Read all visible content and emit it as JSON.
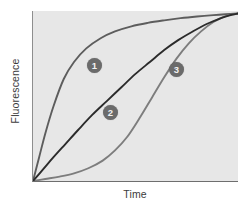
{
  "chart_data": {
    "type": "line",
    "title": "",
    "xlabel": "Time",
    "ylabel": "Fluorescence",
    "grid": false,
    "legend": "inline-markers",
    "xlim": [
      0,
      100
    ],
    "ylim": [
      0,
      100
    ],
    "axis_ticks": {
      "x": [],
      "y": []
    },
    "series": [
      {
        "name": "1",
        "marker_label": "1",
        "color": "#5d5d5d",
        "description": "rapid hyperbolic rise reaching plateau early",
        "x": [
          0,
          3,
          6,
          10,
          15,
          20,
          26,
          33,
          40,
          48,
          56,
          64,
          72,
          80,
          88,
          94,
          100
        ],
        "y": [
          0,
          14,
          28,
          44,
          60,
          70,
          78,
          84,
          88,
          91,
          93,
          94.5,
          95.8,
          96.8,
          97.6,
          98.1,
          98.5
        ]
      },
      {
        "name": "2",
        "marker_label": "2",
        "color": "#2b2b2b",
        "description": "near-linear then gradual saturation",
        "x": [
          0,
          5,
          10,
          16,
          22,
          29,
          36,
          43,
          50,
          57,
          64,
          71,
          78,
          85,
          92,
          96,
          100
        ],
        "y": [
          0,
          7,
          14,
          22,
          30,
          39,
          47,
          55,
          63,
          70,
          77,
          83,
          88,
          92.5,
          96,
          97.5,
          98.5
        ]
      },
      {
        "name": "3",
        "marker_label": "3",
        "color": "#7d7d7d",
        "description": "sigmoidal with pronounced lag phase",
        "x": [
          0,
          6,
          13,
          20,
          27,
          34,
          40,
          46,
          52,
          58,
          64,
          70,
          76,
          82,
          88,
          94,
          100
        ],
        "y": [
          0,
          1.2,
          2.6,
          4.5,
          7.5,
          12,
          18,
          26,
          37,
          49,
          61,
          72,
          81,
          88,
          93.5,
          97,
          98.5
        ]
      }
    ]
  }
}
